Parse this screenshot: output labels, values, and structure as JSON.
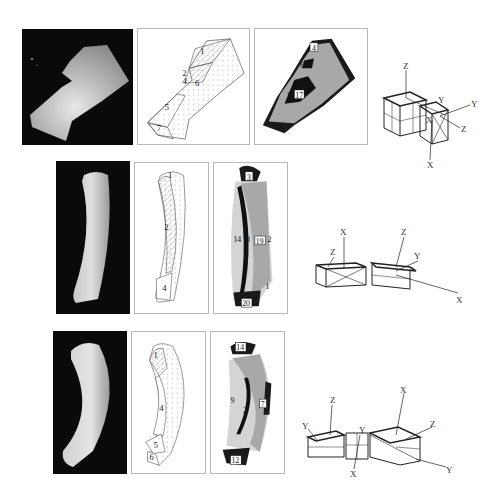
{
  "figure": {
    "rows": [
      {
        "id": "row1",
        "object": "L-shaped block",
        "segmentation_labels": [
          "1",
          "2",
          "4",
          "6",
          "5",
          "7"
        ],
        "region_labels": [
          "4",
          "6",
          "16",
          "17",
          "32"
        ],
        "model_axes": [
          "Z",
          "Y",
          "Y",
          "X",
          "Z",
          "X"
        ]
      },
      {
        "id": "row2",
        "object": "curved part",
        "segmentation_labels": [
          "1",
          "2",
          "4"
        ],
        "region_labels": [
          "3",
          "14",
          "8",
          "19",
          "2",
          "1",
          "20"
        ],
        "model_axes": [
          "X",
          "Z",
          "Z",
          "Y",
          "X"
        ]
      },
      {
        "id": "row3",
        "object": "curved part (rotated)",
        "segmentation_labels": [
          "1",
          "4",
          "5",
          "6"
        ],
        "region_labels": [
          "14",
          "9",
          "2",
          "7",
          "12"
        ],
        "model_axes": [
          "Z",
          "X",
          "Y",
          "Y",
          "Z",
          "Y",
          "X"
        ]
      }
    ]
  }
}
